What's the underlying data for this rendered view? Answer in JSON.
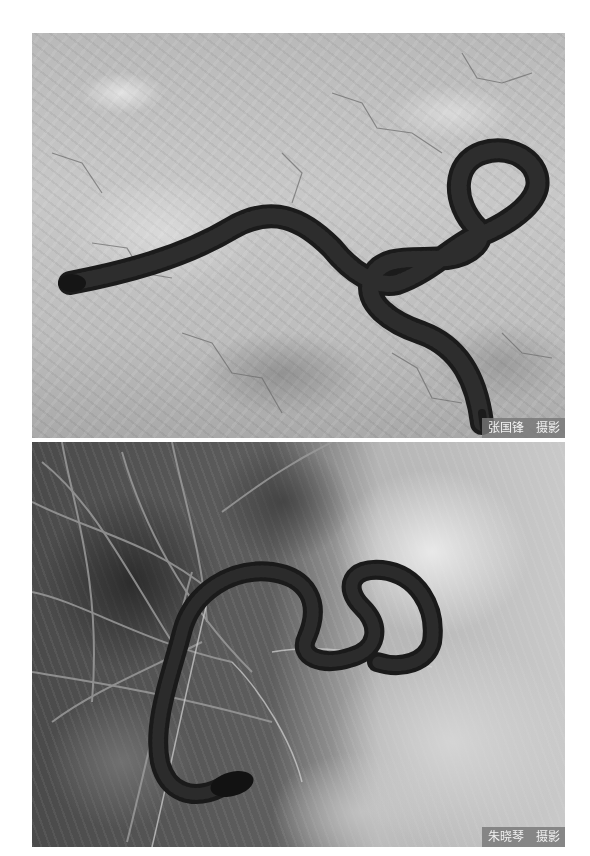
{
  "photos": [
    {
      "id": "top",
      "subject": "dark snake crossing cracked dry soil",
      "caption": {
        "photographer": "张国锋",
        "credit": "摄影"
      }
    },
    {
      "id": "bottom",
      "subject": "dark snake coiled among dry grass and rock",
      "caption": {
        "photographer": "朱晓琴",
        "credit": "摄影"
      }
    }
  ]
}
